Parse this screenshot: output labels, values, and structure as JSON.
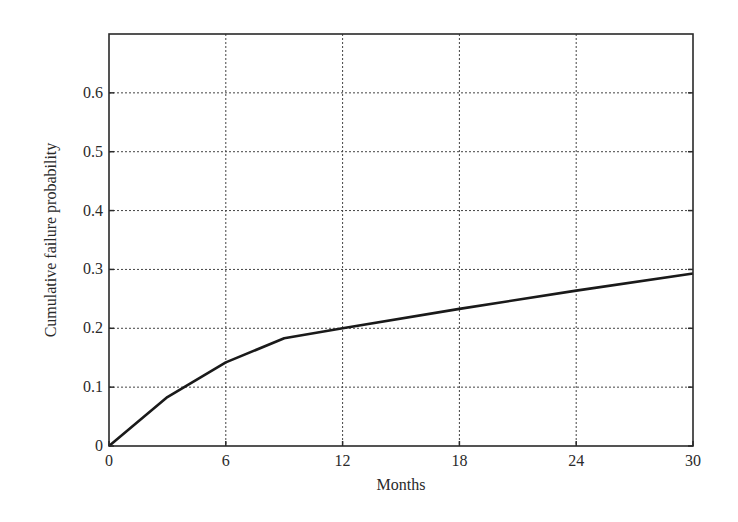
{
  "chart_data": {
    "type": "line",
    "title": "",
    "xlabel": "Months",
    "ylabel": "Cumulative failure probability",
    "xlim": [
      0,
      30
    ],
    "ylim": [
      0,
      0.7
    ],
    "grid": true,
    "grid_style": "dotted",
    "legend": null,
    "x_ticks": [
      0,
      6,
      12,
      18,
      24,
      30
    ],
    "x_tick_labels": [
      "0",
      "6",
      "12",
      "18",
      "24",
      "30"
    ],
    "y_ticks": [
      0,
      0.1,
      0.2,
      0.3,
      0.4,
      0.5,
      0.6
    ],
    "y_tick_labels": [
      "0",
      "0.1",
      "0.2",
      "0.3",
      "0.4",
      "0.5",
      "0.6"
    ],
    "series": [
      {
        "name": "Cumulative failure probability",
        "color": "#1a1a1a",
        "x": [
          0,
          3,
          6,
          9,
          12,
          18,
          24,
          30
        ],
        "y": [
          0.0,
          0.083,
          0.142,
          0.183,
          0.2,
          0.233,
          0.264,
          0.293
        ]
      }
    ]
  }
}
